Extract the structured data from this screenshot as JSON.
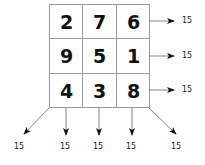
{
  "diagram": {
    "type": "magic-square",
    "grid": [
      [
        2,
        7,
        6
      ],
      [
        9,
        5,
        1
      ],
      [
        4,
        3,
        8
      ]
    ],
    "cells": [
      "2",
      "7",
      "6",
      "9",
      "5",
      "1",
      "4",
      "3",
      "8"
    ],
    "row_sums": [
      "15",
      "15",
      "15"
    ],
    "bottom_sums": [
      "15",
      "15",
      "15",
      "15",
      "15"
    ],
    "colors": {
      "grid_line": "#999999",
      "text": "#111111",
      "arrow": "#555555"
    }
  }
}
